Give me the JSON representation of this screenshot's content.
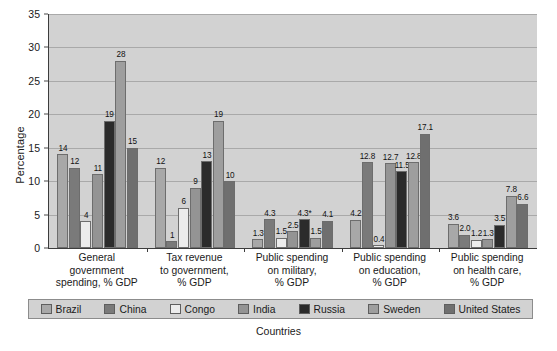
{
  "chart_data": {
    "type": "bar",
    "title": "",
    "xlabel": "Countries",
    "ylabel": "Percentage",
    "ylim": [
      0,
      35
    ],
    "ytick_step": 5,
    "yticks": [
      "0",
      "5",
      "10",
      "15",
      "20",
      "25",
      "30",
      "35"
    ],
    "grid": true,
    "legend_position": "bottom",
    "categories": [
      "General\ngovernment\nspending, % GDP",
      "Tax revenue\nto government,\n% GDP",
      "Public spending\non military,\n% GDP",
      "Public spending\non education,\n% GDP",
      "Public spending\non health care,\n% GDP"
    ],
    "series": [
      {
        "name": "Brazil",
        "color": "#a8a8a8",
        "values": [
          14,
          12,
          1.3,
          4.2,
          3.6
        ],
        "labels": [
          "14",
          "12",
          "1.3",
          "4.2",
          "3.6"
        ]
      },
      {
        "name": "China",
        "color": "#7a7a7a",
        "values": [
          12,
          1,
          4.3,
          12.8,
          2.0
        ],
        "labels": [
          "12",
          "1",
          "4.3",
          "12.8",
          "2.0"
        ]
      },
      {
        "name": "Congo",
        "color": "#ececec",
        "values": [
          4,
          6,
          1.5,
          0.4,
          1.2
        ],
        "labels": [
          "4",
          "6",
          "1.5",
          "0.4",
          "1.2"
        ]
      },
      {
        "name": "India",
        "color": "#949494",
        "values": [
          11,
          9,
          2.5,
          12.7,
          1.3
        ],
        "labels": [
          "11",
          "9",
          "2.5",
          "12.7",
          "1.3"
        ]
      },
      {
        "name": "Russia",
        "color": "#2b2b2b",
        "values": [
          19,
          13,
          4.3,
          11.5,
          3.5
        ],
        "labels": [
          "19",
          "13",
          "4.3*",
          "11.5",
          "3.5"
        ]
      },
      {
        "name": "Sweden",
        "color": "#9e9e9e",
        "values": [
          28,
          19,
          1.5,
          12.8,
          7.8
        ],
        "labels": [
          "28",
          "19",
          "1.5",
          "12.8",
          "7.8"
        ]
      },
      {
        "name": "United States",
        "color": "#6f6f6f",
        "values": [
          15,
          10,
          4.1,
          17.1,
          6.6
        ],
        "labels": [
          "15",
          "10",
          "4.1",
          "17.1",
          "6.6"
        ]
      }
    ]
  },
  "legend": {
    "items": [
      "Brazil",
      "China",
      "Congo",
      "India",
      "Russia",
      "Sweden",
      "United States"
    ]
  },
  "axes": {
    "y_title": "Percentage",
    "x_title": "Countries"
  }
}
